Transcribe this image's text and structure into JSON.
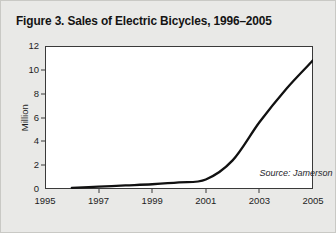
{
  "figure": {
    "title": "Figure 3. Sales of Electric Bicycles, 1996–2005",
    "source_note": "Source: Jamerson"
  },
  "chart_data": {
    "type": "line",
    "title": "Figure 3. Sales of Electric Bicycles, 1996–2005",
    "xlabel": "",
    "ylabel": "Million",
    "xlim": [
      1995,
      2005
    ],
    "ylim": [
      0,
      12
    ],
    "grid": false,
    "legend": null,
    "x_tick_labels": [
      "1995",
      "1997",
      "1999",
      "2001",
      "2003",
      "2005"
    ],
    "x_ticks": [
      1995,
      1997,
      1999,
      2001,
      2003,
      2005
    ],
    "y_tick_labels": [
      "0",
      "2",
      "4",
      "6",
      "8",
      "10",
      "12"
    ],
    "y_ticks": [
      0,
      2,
      4,
      6,
      8,
      10,
      12
    ],
    "line_color": "#111111",
    "line_width_px": 2.3,
    "annotations": [
      {
        "text": "Source: Jamerson",
        "x": 2003.0,
        "y": 1.35,
        "style": "italic"
      }
    ],
    "series": [
      {
        "name": "Sales of Electric Bicycles",
        "x": [
          1996,
          1997,
          1998,
          1999,
          2000,
          2001,
          2002,
          2003,
          2004,
          2005
        ],
        "values": [
          0.1,
          0.2,
          0.3,
          0.4,
          0.55,
          0.8,
          2.4,
          5.6,
          8.4,
          10.8
        ],
        "units": "Million"
      }
    ]
  },
  "colors": {
    "background": "#e9e9e7",
    "plot_background": "#ffffff",
    "axis": "#3a3a3a",
    "text": "#1d1d1d",
    "line": "#111111"
  }
}
